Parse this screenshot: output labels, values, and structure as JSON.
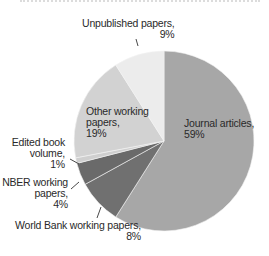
{
  "chart_data": {
    "type": "pie",
    "title": "",
    "start_angle_deg": 0,
    "direction": "clockwise",
    "slices": [
      {
        "label": "Journal articles",
        "value": 59,
        "color": "#a7a7a7"
      },
      {
        "label": "World Bank working papers",
        "value": 8,
        "color": "#707070"
      },
      {
        "label": "NBER working papers",
        "value": 4,
        "color": "#6a6a6a"
      },
      {
        "label": "Edited book volume",
        "value": 1,
        "color": "#cfcfcf"
      },
      {
        "label": "Other working papers",
        "value": 19,
        "color": "#d2d2d2"
      },
      {
        "label": "Unpublished papers",
        "value": 9,
        "color": "#ececec"
      }
    ]
  },
  "labels": {
    "journal": {
      "line1": "Journal articles,",
      "line2": "59%"
    },
    "worldbank": {
      "line1": "World Bank working papers,",
      "line2": "8%"
    },
    "nber": {
      "line1": "NBER working",
      "line2": "papers,",
      "line3": "4%"
    },
    "edited": {
      "line1": "Edited book",
      "line2": "volume,",
      "line3": "1%"
    },
    "other": {
      "line1": "Other working",
      "line2": "papers,",
      "line3": "19%"
    },
    "unpublished": {
      "line1": "Unpublished papers,",
      "line2": "9%"
    }
  }
}
